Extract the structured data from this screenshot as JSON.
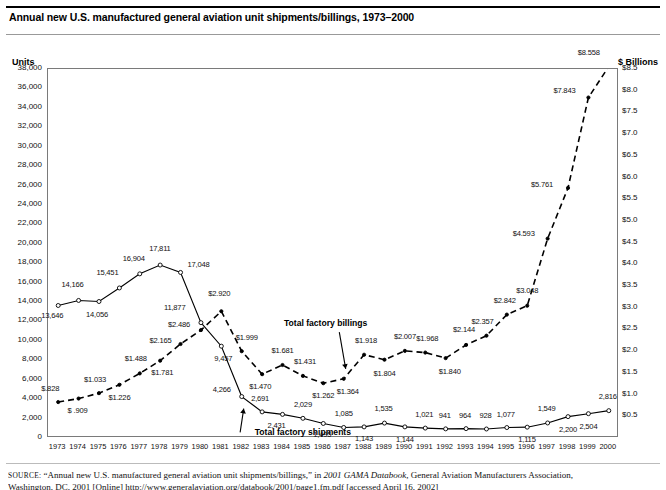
{
  "header": {
    "title": "Annual new U.S. manufactured general aviation unit shipments/billings, 1973–2000"
  },
  "axes": {
    "left_caption": "Units",
    "right_caption": "$ Billions",
    "left_ticks": [
      "38,000",
      "36,000",
      "34,000",
      "32,000",
      "30,000",
      "28,000",
      "26,000",
      "24,000",
      "22,000",
      "20,000",
      "18,000",
      "16,000",
      "14,000",
      "12,000",
      "10,000",
      "8,000",
      "6,000",
      "4,000",
      "2,000",
      "0"
    ],
    "right_ticks": [
      "$8.5",
      "$8.0",
      "$7.5",
      "$7.0",
      "$6.5",
      "$6.0",
      "$5.5",
      "$5.0",
      "$4.5",
      "$4.0",
      "$3.5",
      "$3.0",
      "$2.5",
      "$2.0",
      "$1.5",
      "$1.0",
      "$0.5"
    ]
  },
  "series_labels": {
    "shipments": "Total factory shipments",
    "billings": "Total factory billings"
  },
  "source": {
    "label": "SOURCE:",
    "line1_a": " “Annual new U.S. manufactured general aviation unit shipments/billings,” in ",
    "line1_italic": "2001 GAMA Databook",
    "line1_b": ", General Aviation Manufacturers Association,",
    "line2": "Washington, DC, 2001 [Online] http://www.generalaviation.org/databook/2001/page1.fm.pdf [accessed April 16, 2002]"
  },
  "chart_data": {
    "type": "line",
    "title": "Annual new U.S. manufactured general aviation unit shipments/billings, 1973–2000",
    "xlabel": "",
    "ylabel": "Units",
    "y2label": "$ Billions",
    "ylim": [
      0,
      38000
    ],
    "y2lim": [
      0,
      8.5
    ],
    "grid": false,
    "legend": "inline-annotations",
    "categories": [
      1973,
      1974,
      1975,
      1976,
      1977,
      1978,
      1979,
      1980,
      1981,
      1982,
      1983,
      1984,
      1985,
      1986,
      1987,
      1988,
      1989,
      1990,
      1991,
      1992,
      1993,
      1994,
      1995,
      1996,
      1997,
      1998,
      1999,
      2000
    ],
    "series": [
      {
        "name": "Total factory shipments",
        "axis": "left",
        "unit": "units",
        "marker": "open-circle",
        "line": "solid",
        "values": [
          13646,
          14166,
          14056,
          15451,
          16904,
          17811,
          17048,
          11877,
          9457,
          4266,
          2691,
          2431,
          2029,
          1495,
          1085,
          1143,
          1535,
          1144,
          1021,
          941,
          964,
          928,
          1077,
          1115,
          1549,
          2200,
          2504,
          2816
        ],
        "labels": [
          "13,646",
          "14,166",
          "14,056",
          "15,451",
          "16,904",
          "17,811",
          "17,048",
          "11,877",
          "9,457",
          "4,266",
          "2,691",
          "2,431",
          "2,029",
          "1,495",
          "1,085",
          "1,143",
          "1,535",
          "1,144",
          "1,021",
          "941",
          "964",
          "928",
          "1,077",
          "1,115",
          "1,549",
          "2,200",
          "2,504",
          "2,816"
        ]
      },
      {
        "name": "Total factory billings",
        "axis": "right",
        "unit": "$ billions",
        "marker": "filled-dot",
        "line": "dashed",
        "values": [
          0.828,
          0.909,
          1.033,
          1.226,
          1.488,
          1.781,
          2.165,
          2.486,
          2.92,
          1.999,
          1.47,
          1.681,
          1.431,
          1.262,
          1.364,
          1.918,
          1.804,
          2.007,
          1.968,
          1.84,
          2.144,
          2.357,
          2.842,
          3.048,
          4.593,
          5.761,
          7.843,
          8.558
        ],
        "labels": [
          "$.828",
          "$ .909",
          "$1.033",
          "$1.226",
          "$1.488",
          "$1.781",
          "$2.165",
          "$2.486",
          "$2.920",
          "$1.999",
          "$1.470",
          "$1.681",
          "$1.431",
          "$1.262",
          "$1.364",
          "$1.918",
          "$1.804",
          "$2.007",
          "$1.968",
          "$1.840",
          "$2.144",
          "$2.357",
          "$2.842",
          "$3.048",
          "$4.593",
          "$5.761",
          "$7.843",
          "$8.558"
        ]
      }
    ]
  },
  "label_positions": {
    "shipments": [
      {
        "i": 0,
        "dx": -16,
        "dy": 12
      },
      {
        "i": 1,
        "dx": -16,
        "dy": -14
      },
      {
        "i": 2,
        "dx": -12,
        "dy": 14
      },
      {
        "i": 3,
        "dx": -22,
        "dy": -14
      },
      {
        "i": 4,
        "dx": -16,
        "dy": -14
      },
      {
        "i": 5,
        "dx": -10,
        "dy": -15
      },
      {
        "i": 6,
        "dx": 8,
        "dy": -6
      },
      {
        "i": 7,
        "dx": -36,
        "dy": -14
      },
      {
        "i": 8,
        "dx": -6,
        "dy": 14
      },
      {
        "i": 9,
        "dx": -28,
        "dy": -6
      },
      {
        "i": 10,
        "dx": -10,
        "dy": -12
      },
      {
        "i": 11,
        "dx": -14,
        "dy": 13
      },
      {
        "i": 12,
        "dx": -8,
        "dy": -12
      },
      {
        "i": 13,
        "dx": -9,
        "dy": 13
      },
      {
        "i": 14,
        "dx": -8,
        "dy": -12
      },
      {
        "i": 15,
        "dx": -8,
        "dy": 13
      },
      {
        "i": 16,
        "dx": -9,
        "dy": -13
      },
      {
        "i": 17,
        "dx": -8,
        "dy": 14
      },
      {
        "i": 18,
        "dx": -9,
        "dy": -12
      },
      {
        "i": 19,
        "dx": -6,
        "dy": -12
      },
      {
        "i": 20,
        "dx": -6,
        "dy": -12
      },
      {
        "i": 21,
        "dx": -6,
        "dy": -12
      },
      {
        "i": 22,
        "dx": -9,
        "dy": -12
      },
      {
        "i": 23,
        "dx": -8,
        "dy": 14
      },
      {
        "i": 24,
        "dx": -9,
        "dy": -13
      },
      {
        "i": 25,
        "dx": -8,
        "dy": 14
      },
      {
        "i": 26,
        "dx": -8,
        "dy": 14
      },
      {
        "i": 27,
        "dx": -9,
        "dy": -13
      }
    ],
    "billings": [
      {
        "i": 0,
        "dx": -16,
        "dy": -12
      },
      {
        "i": 1,
        "dx": -10,
        "dy": 13
      },
      {
        "i": 2,
        "dx": -14,
        "dy": -12
      },
      {
        "i": 3,
        "dx": -10,
        "dy": 14
      },
      {
        "i": 4,
        "dx": -14,
        "dy": -13
      },
      {
        "i": 5,
        "dx": -8,
        "dy": 13
      },
      {
        "i": 6,
        "dx": -30,
        "dy": -2
      },
      {
        "i": 7,
        "dx": -32,
        "dy": -4
      },
      {
        "i": 8,
        "dx": -12,
        "dy": -16
      },
      {
        "i": 9,
        "dx": -5,
        "dy": -12
      },
      {
        "i": 10,
        "dx": -12,
        "dy": 14
      },
      {
        "i": 11,
        "dx": -10,
        "dy": -13
      },
      {
        "i": 12,
        "dx": -8,
        "dy": -13
      },
      {
        "i": 13,
        "dx": -10,
        "dy": 14
      },
      {
        "i": 14,
        "dx": -6,
        "dy": 14
      },
      {
        "i": 15,
        "dx": -8,
        "dy": -13
      },
      {
        "i": 16,
        "dx": -10,
        "dy": 15
      },
      {
        "i": 17,
        "dx": -10,
        "dy": -13
      },
      {
        "i": 18,
        "dx": -8,
        "dy": -13
      },
      {
        "i": 19,
        "dx": -6,
        "dy": 15
      },
      {
        "i": 20,
        "dx": -12,
        "dy": -14
      },
      {
        "i": 21,
        "dx": -14,
        "dy": -13
      },
      {
        "i": 22,
        "dx": -12,
        "dy": -13
      },
      {
        "i": 23,
        "dx": -10,
        "dy": -14
      },
      {
        "i": 24,
        "dx": -34,
        "dy": -4
      },
      {
        "i": 25,
        "dx": -36,
        "dy": -2
      },
      {
        "i": 26,
        "dx": -34,
        "dy": -6
      },
      {
        "i": 27,
        "dx": -30,
        "dy": -12
      }
    ]
  }
}
